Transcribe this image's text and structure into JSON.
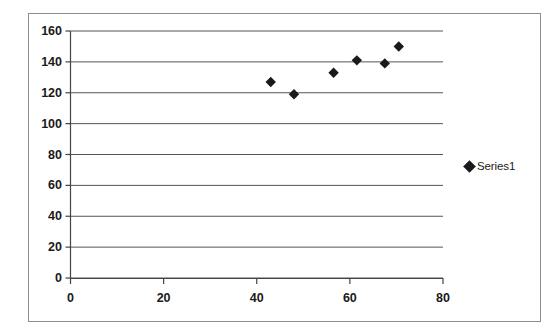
{
  "chart_data": {
    "type": "scatter",
    "title": "",
    "xlabel": "",
    "ylabel": "",
    "xlim": [
      0,
      80
    ],
    "ylim": [
      0,
      160
    ],
    "xticks": [
      0,
      20,
      40,
      60,
      80
    ],
    "yticks": [
      0,
      20,
      40,
      60,
      80,
      100,
      120,
      140,
      160
    ],
    "grid": "horizontal",
    "legend_position": "right",
    "series": [
      {
        "name": "Series1",
        "marker": "diamond",
        "color": "#1a1a1a",
        "points": [
          {
            "x": 43,
            "y": 127
          },
          {
            "x": 48,
            "y": 119
          },
          {
            "x": 56.5,
            "y": 133
          },
          {
            "x": 61.5,
            "y": 141
          },
          {
            "x": 67.5,
            "y": 139
          },
          {
            "x": 70.5,
            "y": 150
          }
        ]
      }
    ]
  },
  "axes": {
    "y_tick_labels": [
      "160",
      "140",
      "120",
      "100",
      "80",
      "60",
      "40",
      "20",
      "0"
    ],
    "x_tick_labels": [
      "0",
      "20",
      "40",
      "60",
      "80"
    ]
  },
  "legend": {
    "entries": [
      {
        "label": "Series1",
        "marker": "diamond-marker"
      }
    ]
  },
  "colors": {
    "marker": "#1a1a1a",
    "gridline": "#555555",
    "axis": "#444444",
    "border": "#8e8e8e",
    "background": "#ffffff"
  }
}
